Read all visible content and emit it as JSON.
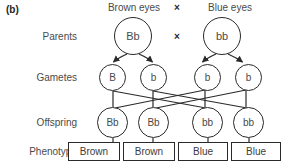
{
  "figure": {
    "panel_label": "(b)",
    "cross_symbol": "×"
  },
  "row_labels": {
    "parents": "Parents",
    "gametes": "Gametes",
    "offspring": "Offspring",
    "phenotype": "Phenotype"
  },
  "parent_captions": {
    "left": "Brown eyes",
    "right": "Blue eyes"
  },
  "parents": [
    {
      "genotype": "Bb"
    },
    {
      "genotype": "bb"
    }
  ],
  "gametes": [
    {
      "allele": "B"
    },
    {
      "allele": "b"
    },
    {
      "allele": "b"
    },
    {
      "allele": "b"
    }
  ],
  "offspring": [
    {
      "genotype": "Bb"
    },
    {
      "genotype": "Bb"
    },
    {
      "genotype": "bb"
    },
    {
      "genotype": "bb"
    }
  ],
  "phenotypes": [
    {
      "label": "Brown"
    },
    {
      "label": "Brown"
    },
    {
      "label": "Blue"
    },
    {
      "label": "Blue"
    }
  ],
  "colors": {
    "stroke": "#2a2a2a",
    "text": "#4a4a4a",
    "background": "#ffffff"
  }
}
